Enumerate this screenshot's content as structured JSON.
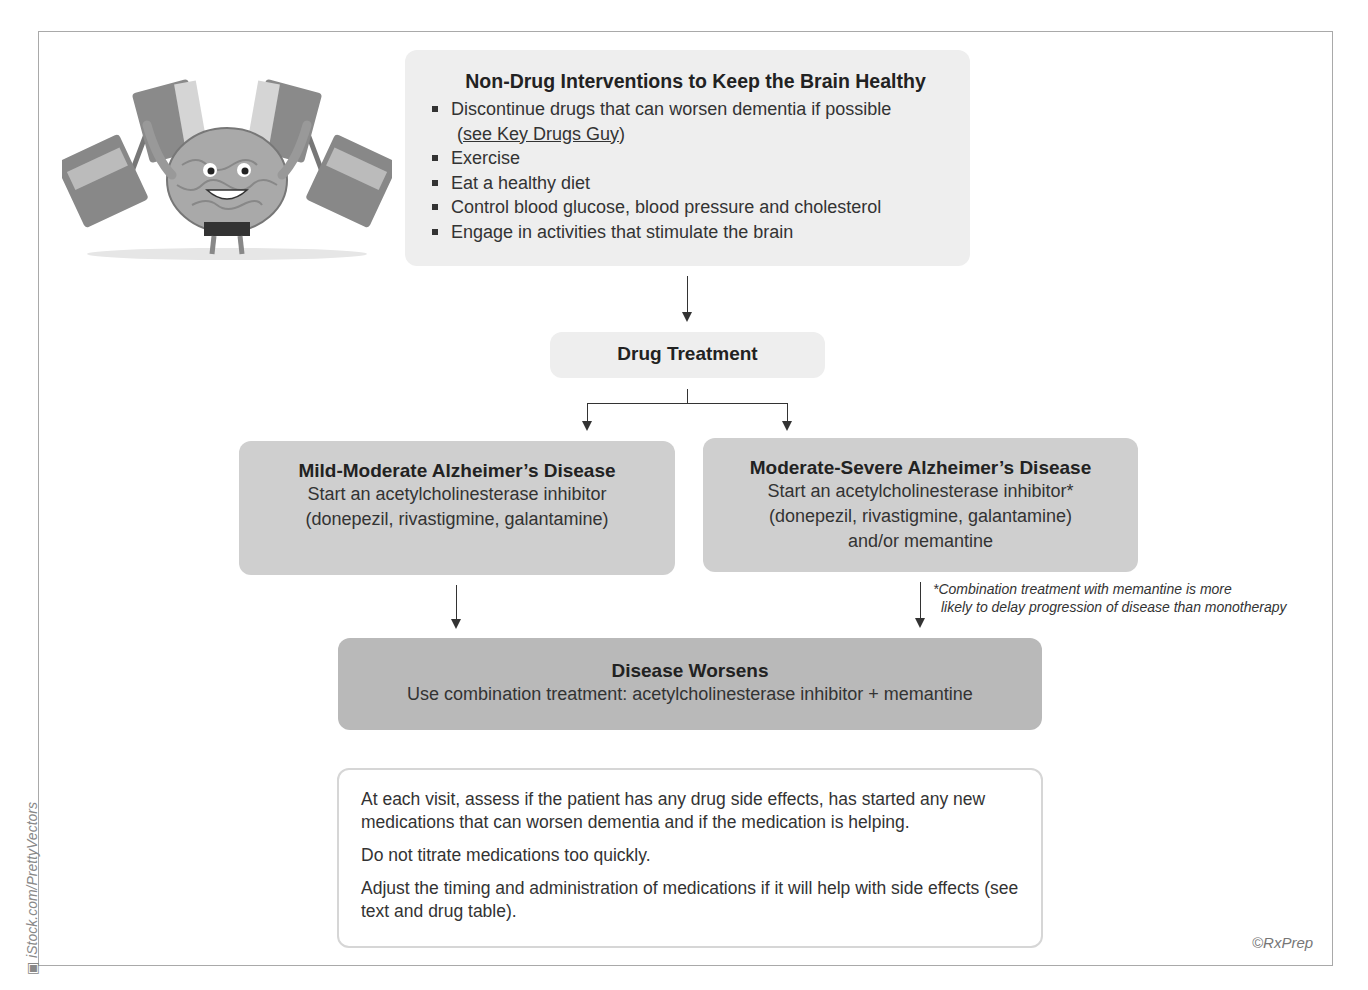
{
  "nondrug": {
    "title": "Non-Drug Interventions to Keep the Brain Healthy",
    "items": [
      {
        "text": "Discontinue drugs that can worsen dementia if possible"
      },
      {
        "text": "Exercise"
      },
      {
        "text": "Eat a healthy diet"
      },
      {
        "text": "Control blood glucose, blood pressure and cholesterol"
      },
      {
        "text": "Engage in activities that stimulate the brain"
      }
    ],
    "link_prefix": "(",
    "link_text": "see Key Drugs Guy",
    "link_suffix": ")"
  },
  "drug_treatment": {
    "title": "Drug Treatment"
  },
  "mild": {
    "title": "Mild-Moderate Alzheimer’s Disease",
    "line1": "Start an acetylcholinesterase inhibitor",
    "line2": "(donepezil, rivastigmine, galantamine)"
  },
  "modsev": {
    "title": "Moderate-Severe Alzheimer’s Disease",
    "line1": "Start an acetylcholinesterase inhibitor*",
    "line2": "(donepezil, rivastigmine, galantamine)",
    "line3": "and/or memantine"
  },
  "footnote": {
    "line1": "*Combination treatment with memantine is more",
    "line2": "likely to delay progression of disease than monotherapy"
  },
  "worsens": {
    "title": "Disease Worsens",
    "line1": "Use combination treatment: acetylcholinesterase inhibitor + memantine"
  },
  "notes": {
    "p1": "At each visit, assess if the patient has any drug side effects, has started any new medications that can worsen dementia and if the medication is helping.",
    "p2": "Do not titrate medications too quickly.",
    "p3": "Adjust the timing and administration of medications if it will help with side effects (see text and drug table)."
  },
  "credits": {
    "copyright": "©RxPrep",
    "image_credit": "iStock.com/PrettyVectors"
  },
  "illustration": {
    "icon": "brain-lifting-books-icon"
  },
  "colors": {
    "light_box": "#eeeeee",
    "mid_box": "#cfcfcf",
    "dark_box": "#b9b9b9",
    "frame": "#a9a9a9"
  }
}
